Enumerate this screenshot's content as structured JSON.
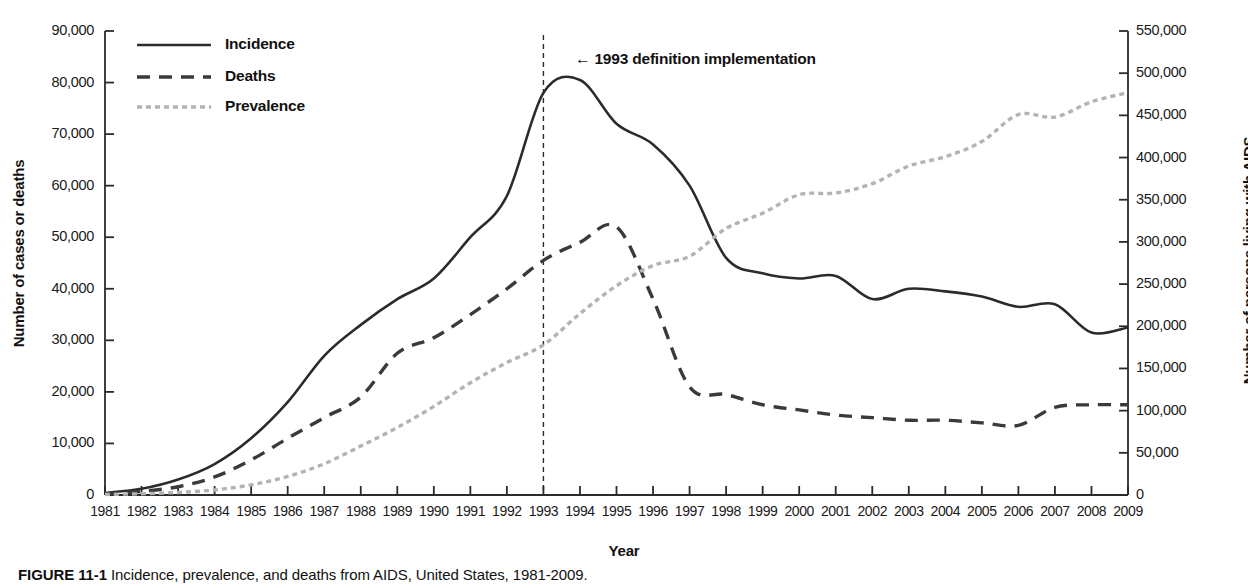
{
  "chart_data": {
    "type": "line",
    "title": "",
    "xlabel": "Year",
    "ylabel": "Number of cases or deaths",
    "ylabel_right": "Number of persons living with AIDS",
    "grid": false,
    "legend_position": "top-left",
    "x": [
      1981,
      1982,
      1983,
      1984,
      1985,
      1986,
      1987,
      1988,
      1989,
      1990,
      1991,
      1992,
      1993,
      1994,
      1995,
      1996,
      1997,
      1998,
      1999,
      2000,
      2001,
      2002,
      2003,
      2004,
      2005,
      2006,
      2007,
      2008,
      2009
    ],
    "xtick_labels": [
      "1981",
      "1982",
      "1983",
      "1984",
      "1985",
      "1986",
      "1987",
      "1988",
      "1989",
      "1990",
      "1991",
      "1992",
      "1993",
      "1994",
      "1995",
      "1996",
      "1997",
      "1998",
      "1999",
      "2000",
      "2001",
      "2002",
      "2003",
      "2004",
      "2005",
      "2006",
      "2007",
      "2008",
      "2009"
    ],
    "ylim": [
      0,
      90000
    ],
    "ytick_values": [
      0,
      10000,
      20000,
      30000,
      40000,
      50000,
      60000,
      70000,
      80000,
      90000
    ],
    "ytick_labels": [
      "0",
      "10,000",
      "20,000",
      "30,000",
      "40,000",
      "50,000",
      "60,000",
      "70,000",
      "80,000",
      "90,000"
    ],
    "ylim_right": [
      0,
      550000
    ],
    "ytick_values_right": [
      0,
      50000,
      100000,
      150000,
      200000,
      250000,
      300000,
      350000,
      400000,
      450000,
      500000,
      550000
    ],
    "ytick_labels_right": [
      "0",
      "50,000",
      "100,000",
      "150,000",
      "200,000",
      "250,000",
      "300,000",
      "350,000",
      "400,000",
      "450,000",
      "500,000",
      "550,000"
    ],
    "series": [
      {
        "name": "Incidence",
        "axis": "left",
        "style": "solid",
        "color": "#2b2b2b",
        "values": [
          400,
          1200,
          3000,
          6000,
          11000,
          18000,
          27000,
          33000,
          38000,
          42000,
          50000,
          58000,
          78000,
          80500,
          72000,
          68000,
          60000,
          46000,
          43000,
          42000,
          42500,
          38000,
          40000,
          39500,
          38500,
          36500,
          37000,
          31500,
          32500
        ]
      },
      {
        "name": "Deaths",
        "axis": "left",
        "style": "dashed",
        "color": "#3a3a3a",
        "values": [
          200,
          700,
          1600,
          3500,
          6800,
          11000,
          15000,
          19000,
          27500,
          30500,
          35000,
          40000,
          45500,
          49000,
          52000,
          38000,
          21000,
          19500,
          17500,
          16500,
          15500,
          15000,
          14500,
          14500,
          14000,
          13500,
          17000,
          17500,
          17500
        ]
      },
      {
        "name": "Prevalence",
        "axis": "right",
        "style": "dotted",
        "color": "#b3b3b3",
        "values": [
          600,
          1500,
          3000,
          6000,
          12000,
          22000,
          37000,
          58000,
          80000,
          105000,
          133000,
          157000,
          178000,
          215000,
          248000,
          272000,
          283000,
          316000,
          334000,
          356000,
          358000,
          369000,
          390000,
          401000,
          419000,
          451000,
          448000,
          466000,
          477000
        ]
      }
    ],
    "annotations": [
      {
        "name": "1993-definition-implementation",
        "text": "← 1993 definition implementation",
        "x_year": 1993,
        "marker": "vertical dashed line"
      }
    ]
  },
  "legend": {
    "items": [
      {
        "label": "Incidence",
        "style": "solid"
      },
      {
        "label": "Deaths",
        "style": "dashed"
      },
      {
        "label": "Prevalence",
        "style": "dotted"
      }
    ]
  },
  "annotation": {
    "label": "← 1993 definition implementation"
  },
  "axes": {
    "left_title": "Number of cases or deaths",
    "right_title": "Number of persons living with AIDS",
    "x_title": "Year"
  },
  "caption": {
    "figure_number": "FIGURE 11-1",
    "text": "Incidence, prevalence, and deaths from AIDS, United States, 1981-2009."
  },
  "colors": {
    "incidence": "#2b2b2b",
    "deaths": "#3a3a3a",
    "prevalence": "#b3b3b3",
    "axis": "#2b2b2b",
    "text": "#111111"
  }
}
